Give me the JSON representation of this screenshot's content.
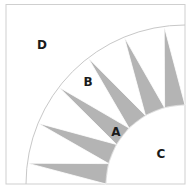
{
  "colors": {
    "background": "#ffffff",
    "frame": "#cfcfcf",
    "arc": "#c8c8c8",
    "spike": "#b4b4b4",
    "label": "#1a1a1a"
  },
  "geometry": {
    "center": [
      185,
      184
    ],
    "inner_radius": 79,
    "outer_radius": 159,
    "spike_count": 6,
    "sector_degrees": 15
  },
  "labels": [
    {
      "id": "A",
      "text": "A",
      "x": 116,
      "y": 136
    },
    {
      "id": "B",
      "text": "B",
      "x": 88,
      "y": 86
    },
    {
      "id": "C",
      "text": "C",
      "x": 161,
      "y": 158
    },
    {
      "id": "D",
      "text": "D",
      "x": 42,
      "y": 49
    }
  ],
  "regions": {
    "A": "spike triangles (gray)",
    "B": "background wedges between spikes",
    "C": "inner quarter circle",
    "D": "outer corner background"
  }
}
